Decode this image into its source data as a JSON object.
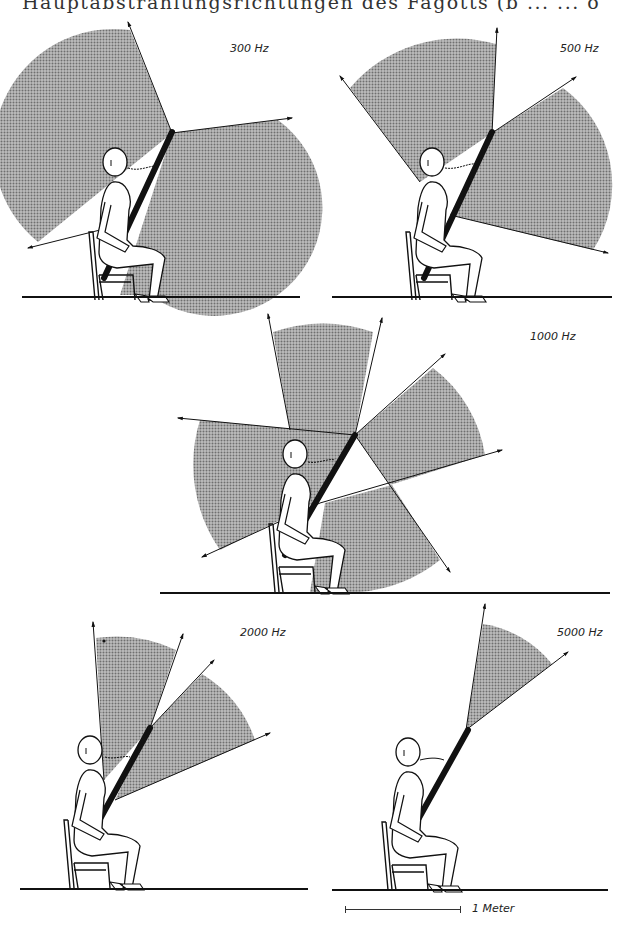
{
  "header": {
    "caption_fragment": "Hauptabstrahlungsrichtungen des Fagotts (b ... ... o"
  },
  "panels": [
    {
      "id": "300hz",
      "frequency_label": "300 Hz",
      "description": "Seated bassoon player; shaded radiation sectors from bell: large upper-left sector and right/down sector"
    },
    {
      "id": "500hz",
      "frequency_label": "500 Hz",
      "description": "Seated bassoon player; upper-left sector to vertical and right sector"
    },
    {
      "id": "1000hz",
      "frequency_label": "1000 Hz",
      "description": "Seated bassoon player; multiple lobes: top, left, upper-right, lower-right"
    },
    {
      "id": "2000hz",
      "frequency_label": "2000 Hz",
      "description": "Seated bassoon player; narrow upward lobe and upper-right lobe"
    },
    {
      "id": "5000hz",
      "frequency_label": "5000 Hz",
      "description": "Seated bassoon player; single narrow lobe upward-right from bell"
    }
  ],
  "scale_bar": {
    "label": "1 Meter"
  },
  "colors": {
    "shade": "#9a9a9a",
    "ink": "#111111",
    "background": "#ffffff"
  }
}
